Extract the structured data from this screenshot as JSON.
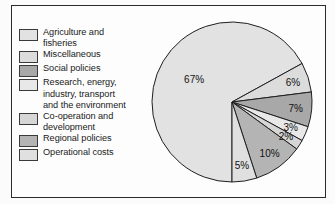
{
  "figure": {
    "background_color": "#fbfbfb",
    "frame_color": "#2b2b2b"
  },
  "legend": {
    "items": [
      {
        "label": "Agriculture and\nfisheries",
        "color": "#e2e2e2",
        "value": 67,
        "value_label": "67%"
      },
      {
        "label": "Miscellaneous",
        "color": "#dcdcdc",
        "value": 6,
        "value_label": "6%"
      },
      {
        "label": "Social policies",
        "color": "#a8a8a8",
        "value": 7,
        "value_label": "7%"
      },
      {
        "label": "Research, energy,\nindustry, transport\nand the environment",
        "color": "#e8e8e8",
        "value": 3,
        "value_label": "3%"
      },
      {
        "label": "Co-operation and\ndevelopment",
        "color": "#d6d6d6",
        "value": 2,
        "value_label": "2%"
      },
      {
        "label": "Regional policies",
        "color": "#b4b4b4",
        "value": 10,
        "value_label": "10%"
      },
      {
        "label": "Operational costs",
        "color": "#e0e0e0",
        "value": 5,
        "value_label": "5%"
      }
    ]
  },
  "chart_data": {
    "type": "pie",
    "title": "",
    "categories": [
      "Agriculture and fisheries",
      "Miscellaneous",
      "Social policies",
      "Research, energy, industry, transport and the environment",
      "Co-operation and development",
      "Regional policies",
      "Operational costs"
    ],
    "values": [
      67,
      6,
      7,
      3,
      2,
      10,
      5
    ],
    "value_labels": [
      "67%",
      "6%",
      "7%",
      "3%",
      "2%",
      "10%",
      "5%"
    ],
    "colors": [
      "#e2e2e2",
      "#dcdcdc",
      "#a8a8a8",
      "#e8e8e8",
      "#d6d6d6",
      "#b4b4b4",
      "#e0e0e0"
    ],
    "units": "percent",
    "total": 100,
    "start_angle_deg": 90,
    "direction": "clockwise",
    "legend_position": "left",
    "grid": false,
    "center": {
      "x": 232,
      "y": 102
    },
    "radius": 80
  }
}
